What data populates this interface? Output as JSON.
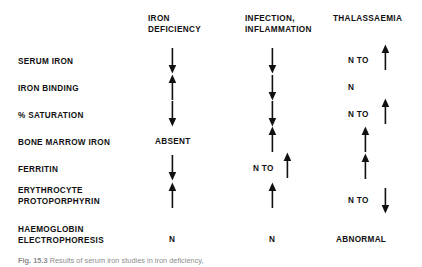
{
  "figure": {
    "type": "comparison-table",
    "caption_label": "Fig. 15.3",
    "caption_text": "Results of serum iron studies in iron deficiency,",
    "background": "#ffffff",
    "ink": "#111111"
  },
  "table": {
    "row_header_label": "",
    "columns": [
      {
        "id": "iron-deficiency",
        "label": "IRON\nDEFICIENCY"
      },
      {
        "id": "infection-inflammation",
        "label": "INFECTION,\nINFLAMMATION"
      },
      {
        "id": "thalassaemia",
        "label": "THALASSAEMIA"
      }
    ],
    "rows": [
      {
        "id": "serum-iron",
        "label": "SERUM IRON",
        "cells": [
          {
            "text": "",
            "arrow": "down"
          },
          {
            "text": "",
            "arrow": "down"
          },
          {
            "text": "N TO",
            "arrow": "up"
          }
        ]
      },
      {
        "id": "iron-binding",
        "label": "IRON BINDING",
        "cells": [
          {
            "text": "",
            "arrow": "up"
          },
          {
            "text": "",
            "arrow": "down"
          },
          {
            "text": "N",
            "arrow": "none"
          }
        ]
      },
      {
        "id": "percent-saturation",
        "label": "% SATURATION",
        "cells": [
          {
            "text": "",
            "arrow": "down"
          },
          {
            "text": "",
            "arrow": "down"
          },
          {
            "text": "N TO",
            "arrow": "up"
          }
        ]
      },
      {
        "id": "bone-marrow-iron",
        "label": "BONE MARROW IRON",
        "cells": [
          {
            "text": "ABSENT",
            "arrow": "none"
          },
          {
            "text": "",
            "arrow": "up"
          },
          {
            "text": "",
            "arrow": "up"
          }
        ]
      },
      {
        "id": "ferritin",
        "label": "FERRITIN",
        "cells": [
          {
            "text": "",
            "arrow": "down"
          },
          {
            "text": "N TO",
            "arrow": "up"
          },
          {
            "text": "",
            "arrow": "up"
          }
        ]
      },
      {
        "id": "erythrocyte-protoporphyrin",
        "label": "ERYTHROCYTE\nPROTOPORPHYRIN",
        "cells": [
          {
            "text": "",
            "arrow": "up"
          },
          {
            "text": "",
            "arrow": "up"
          },
          {
            "text": "N TO",
            "arrow": "down"
          }
        ]
      },
      {
        "id": "haemoglobin-electrophoresis",
        "label": "HAEMOGLOBIN\nELECTROPHORESIS",
        "cells": [
          {
            "text": "N",
            "arrow": "none"
          },
          {
            "text": "N",
            "arrow": "none"
          },
          {
            "text": "ABNORMAL",
            "arrow": "none"
          }
        ]
      }
    ]
  }
}
